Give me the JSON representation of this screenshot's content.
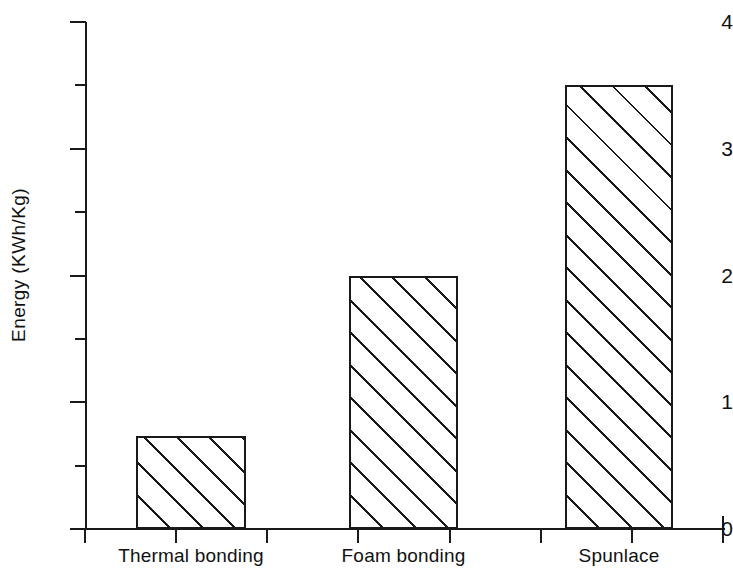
{
  "chart_data": {
    "type": "bar",
    "title": "",
    "xlabel": "",
    "ylabel": "Energy (KWh/Kg)",
    "categories": [
      "Thermal bonding",
      "Foam bonding",
      "Spunlace"
    ],
    "values": [
      0.73,
      2.0,
      3.5
    ],
    "ylim": [
      0,
      4
    ],
    "ytick_labels": [
      "0",
      "1",
      "2",
      "3",
      "4"
    ],
    "ytick_values": [
      0,
      1,
      2,
      3,
      4
    ],
    "yminor_tick_values": [
      0.5,
      1.5,
      2.5,
      3.5
    ],
    "grid": false,
    "legend": null,
    "series": [
      {
        "name": "Energy",
        "values": [
          0.73,
          2.0,
          3.5
        ],
        "fill": "diagonal-hatch",
        "edge_color": "#1a1a1a",
        "face_color": "#ffffff"
      }
    ],
    "annotations": [],
    "background_color": "#ffffff",
    "axis_color": "#1a1a1a"
  }
}
